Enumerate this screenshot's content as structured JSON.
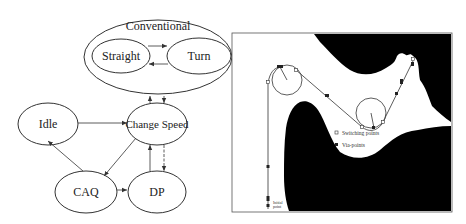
{
  "state_diagram": {
    "groups": [
      {
        "id": "conventional",
        "label": "Conventional",
        "children": [
          "straight",
          "turn"
        ]
      }
    ],
    "states": [
      {
        "id": "straight",
        "label": "Straight"
      },
      {
        "id": "turn",
        "label": "Turn"
      },
      {
        "id": "idle",
        "label": "Idle"
      },
      {
        "id": "change_speed",
        "label": "Change Speed"
      },
      {
        "id": "caq",
        "label": "CAQ"
      },
      {
        "id": "dp",
        "label": "DP"
      }
    ],
    "transitions": [
      {
        "from": "straight",
        "to": "turn"
      },
      {
        "from": "turn",
        "to": "straight"
      },
      {
        "from": "change_speed",
        "to": "conventional"
      },
      {
        "from": "conventional",
        "to": "change_speed"
      },
      {
        "from": "idle",
        "to": "change_speed"
      },
      {
        "from": "change_speed",
        "to": "caq"
      },
      {
        "from": "caq",
        "to": "idle"
      },
      {
        "from": "caq",
        "to": "dp"
      },
      {
        "from": "dp",
        "to": "change_speed"
      },
      {
        "from": "change_speed",
        "to": "dp"
      }
    ]
  },
  "path_map": {
    "legend": [
      {
        "marker": "open-square",
        "label": "Switching points"
      },
      {
        "marker": "filled-square",
        "label": "Via-points"
      }
    ],
    "start_label_line1": "Initial",
    "start_label_line2": "point",
    "colors": {
      "obstacle": "#000000",
      "free_space": "#ffffff",
      "path": "#333333"
    }
  }
}
